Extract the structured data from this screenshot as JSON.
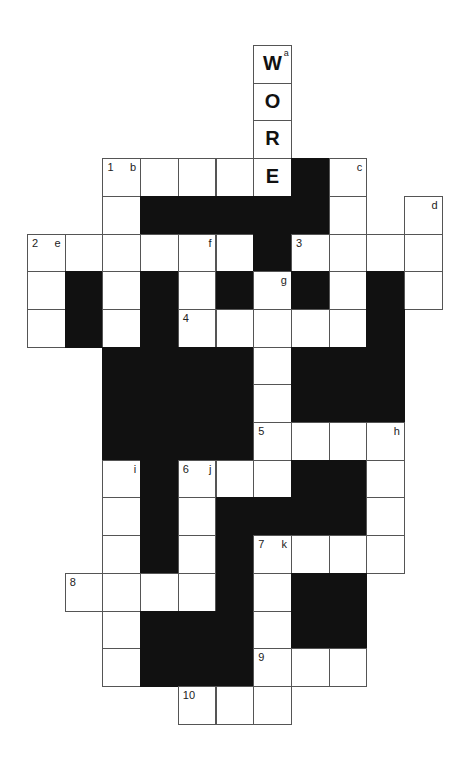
{
  "puzzle": {
    "cell_size": 37.7,
    "origin": {
      "x": 27,
      "y": 45
    },
    "colors": {
      "white": "#ffffff",
      "black": "#111111",
      "line": "#555555"
    },
    "cells": [
      {
        "r": 0,
        "c": 6,
        "fill": "W",
        "tag": "a"
      },
      {
        "r": 1,
        "c": 6,
        "fill": "O"
      },
      {
        "r": 2,
        "c": 6,
        "fill": "R"
      },
      {
        "r": 3,
        "c": 2,
        "num": "1",
        "tag": "b"
      },
      {
        "r": 3,
        "c": 3
      },
      {
        "r": 3,
        "c": 4
      },
      {
        "r": 3,
        "c": 5
      },
      {
        "r": 3,
        "c": 6,
        "fill": "E"
      },
      {
        "r": 3,
        "c": 7,
        "black": true
      },
      {
        "r": 3,
        "c": 8,
        "tag": "c"
      },
      {
        "r": 4,
        "c": 2
      },
      {
        "r": 4,
        "c": 3,
        "black": true
      },
      {
        "r": 4,
        "c": 4,
        "black": true
      },
      {
        "r": 4,
        "c": 5,
        "black": true
      },
      {
        "r": 4,
        "c": 6,
        "black": true
      },
      {
        "r": 4,
        "c": 7,
        "black": true
      },
      {
        "r": 4,
        "c": 8
      },
      {
        "r": 4,
        "c": 10,
        "tag": "d"
      },
      {
        "r": 5,
        "c": 0,
        "num": "2",
        "tag": "e"
      },
      {
        "r": 5,
        "c": 1
      },
      {
        "r": 5,
        "c": 2
      },
      {
        "r": 5,
        "c": 3
      },
      {
        "r": 5,
        "c": 4,
        "tag": "f"
      },
      {
        "r": 5,
        "c": 5
      },
      {
        "r": 5,
        "c": 6,
        "black": true
      },
      {
        "r": 5,
        "c": 7,
        "num": "3"
      },
      {
        "r": 5,
        "c": 8
      },
      {
        "r": 5,
        "c": 9
      },
      {
        "r": 5,
        "c": 10
      },
      {
        "r": 6,
        "c": 0
      },
      {
        "r": 6,
        "c": 1,
        "black": true
      },
      {
        "r": 6,
        "c": 2
      },
      {
        "r": 6,
        "c": 3,
        "black": true
      },
      {
        "r": 6,
        "c": 4
      },
      {
        "r": 6,
        "c": 5,
        "black": true
      },
      {
        "r": 6,
        "c": 6,
        "tag": "g"
      },
      {
        "r": 6,
        "c": 7,
        "black": true
      },
      {
        "r": 6,
        "c": 8
      },
      {
        "r": 6,
        "c": 9,
        "black": true
      },
      {
        "r": 6,
        "c": 10
      },
      {
        "r": 7,
        "c": 0
      },
      {
        "r": 7,
        "c": 1,
        "black": true
      },
      {
        "r": 7,
        "c": 2
      },
      {
        "r": 7,
        "c": 3,
        "black": true
      },
      {
        "r": 7,
        "c": 4,
        "num": "4"
      },
      {
        "r": 7,
        "c": 5
      },
      {
        "r": 7,
        "c": 6
      },
      {
        "r": 7,
        "c": 7
      },
      {
        "r": 7,
        "c": 8
      },
      {
        "r": 7,
        "c": 9,
        "black": true
      },
      {
        "r": 8,
        "c": 2,
        "black": true
      },
      {
        "r": 8,
        "c": 3,
        "black": true
      },
      {
        "r": 8,
        "c": 4,
        "black": true
      },
      {
        "r": 8,
        "c": 5,
        "black": true
      },
      {
        "r": 8,
        "c": 6
      },
      {
        "r": 8,
        "c": 7,
        "black": true
      },
      {
        "r": 8,
        "c": 8,
        "black": true
      },
      {
        "r": 8,
        "c": 9,
        "black": true
      },
      {
        "r": 9,
        "c": 2,
        "black": true
      },
      {
        "r": 9,
        "c": 3,
        "black": true
      },
      {
        "r": 9,
        "c": 4,
        "black": true
      },
      {
        "r": 9,
        "c": 5,
        "black": true
      },
      {
        "r": 9,
        "c": 6
      },
      {
        "r": 9,
        "c": 7,
        "black": true
      },
      {
        "r": 9,
        "c": 8,
        "black": true
      },
      {
        "r": 9,
        "c": 9,
        "black": true
      },
      {
        "r": 10,
        "c": 2,
        "black": true
      },
      {
        "r": 10,
        "c": 3,
        "black": true
      },
      {
        "r": 10,
        "c": 4,
        "black": true
      },
      {
        "r": 10,
        "c": 5,
        "black": true
      },
      {
        "r": 10,
        "c": 6,
        "num": "5"
      },
      {
        "r": 10,
        "c": 7
      },
      {
        "r": 10,
        "c": 8
      },
      {
        "r": 10,
        "c": 9,
        "tag": "h"
      },
      {
        "r": 11,
        "c": 2,
        "tag": "i"
      },
      {
        "r": 11,
        "c": 3,
        "black": true
      },
      {
        "r": 11,
        "c": 4,
        "num": "6",
        "tag": "j"
      },
      {
        "r": 11,
        "c": 5
      },
      {
        "r": 11,
        "c": 6
      },
      {
        "r": 11,
        "c": 7,
        "black": true
      },
      {
        "r": 11,
        "c": 8,
        "black": true
      },
      {
        "r": 11,
        "c": 9
      },
      {
        "r": 12,
        "c": 2
      },
      {
        "r": 12,
        "c": 3,
        "black": true
      },
      {
        "r": 12,
        "c": 4
      },
      {
        "r": 12,
        "c": 5,
        "black": true
      },
      {
        "r": 12,
        "c": 6,
        "black": true
      },
      {
        "r": 12,
        "c": 7,
        "black": true
      },
      {
        "r": 12,
        "c": 8,
        "black": true
      },
      {
        "r": 12,
        "c": 9
      },
      {
        "r": 13,
        "c": 2
      },
      {
        "r": 13,
        "c": 3,
        "black": true
      },
      {
        "r": 13,
        "c": 4
      },
      {
        "r": 13,
        "c": 5,
        "black": true
      },
      {
        "r": 13,
        "c": 6,
        "num": "7",
        "tag": "k"
      },
      {
        "r": 13,
        "c": 7
      },
      {
        "r": 13,
        "c": 8
      },
      {
        "r": 13,
        "c": 9
      },
      {
        "r": 14,
        "c": 1,
        "num": "8"
      },
      {
        "r": 14,
        "c": 2
      },
      {
        "r": 14,
        "c": 3
      },
      {
        "r": 14,
        "c": 4
      },
      {
        "r": 14,
        "c": 5,
        "black": true
      },
      {
        "r": 14,
        "c": 6
      },
      {
        "r": 14,
        "c": 7,
        "black": true
      },
      {
        "r": 14,
        "c": 8,
        "black": true
      },
      {
        "r": 15,
        "c": 2
      },
      {
        "r": 15,
        "c": 3,
        "black": true
      },
      {
        "r": 15,
        "c": 4,
        "black": true
      },
      {
        "r": 15,
        "c": 5,
        "black": true
      },
      {
        "r": 15,
        "c": 6
      },
      {
        "r": 15,
        "c": 7,
        "black": true
      },
      {
        "r": 15,
        "c": 8,
        "black": true
      },
      {
        "r": 16,
        "c": 2
      },
      {
        "r": 16,
        "c": 3,
        "black": true
      },
      {
        "r": 16,
        "c": 4,
        "black": true
      },
      {
        "r": 16,
        "c": 5,
        "black": true
      },
      {
        "r": 16,
        "c": 6,
        "num": "9"
      },
      {
        "r": 16,
        "c": 7
      },
      {
        "r": 16,
        "c": 8
      },
      {
        "r": 17,
        "c": 4,
        "num": "10"
      },
      {
        "r": 17,
        "c": 5
      },
      {
        "r": 17,
        "c": 6
      }
    ]
  }
}
